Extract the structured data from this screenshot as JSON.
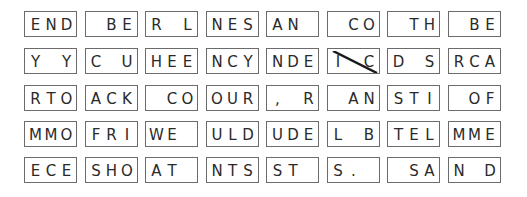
{
  "puzzle": {
    "type": "fallen-phrase tiles",
    "rows": [
      [
        "END",
        " BE",
        "R L",
        "NES",
        "AN ",
        " CO",
        " TH",
        " BE"
      ],
      [
        "Y Y",
        "C U",
        "HEE",
        "NCY",
        "NDE",
        "I C",
        "D S",
        "RCA"
      ],
      [
        "RTO",
        "ACK",
        " CO",
        "OUR",
        ", R",
        " AN",
        "STI",
        " OF"
      ],
      [
        "MMO",
        "FRI",
        "WE ",
        "ULD",
        "UDE",
        "L B",
        "TEL",
        "MME"
      ],
      [
        "ECE",
        "SHO",
        "AT ",
        "NTS",
        "ST ",
        "S. ",
        " SA",
        "N D"
      ]
    ],
    "crossed_out": [
      {
        "row": 1,
        "col": 5
      }
    ],
    "colors": {
      "border": "#6b6b6b",
      "text": "#2a2a2a",
      "strike": "#1a1a1a"
    }
  }
}
